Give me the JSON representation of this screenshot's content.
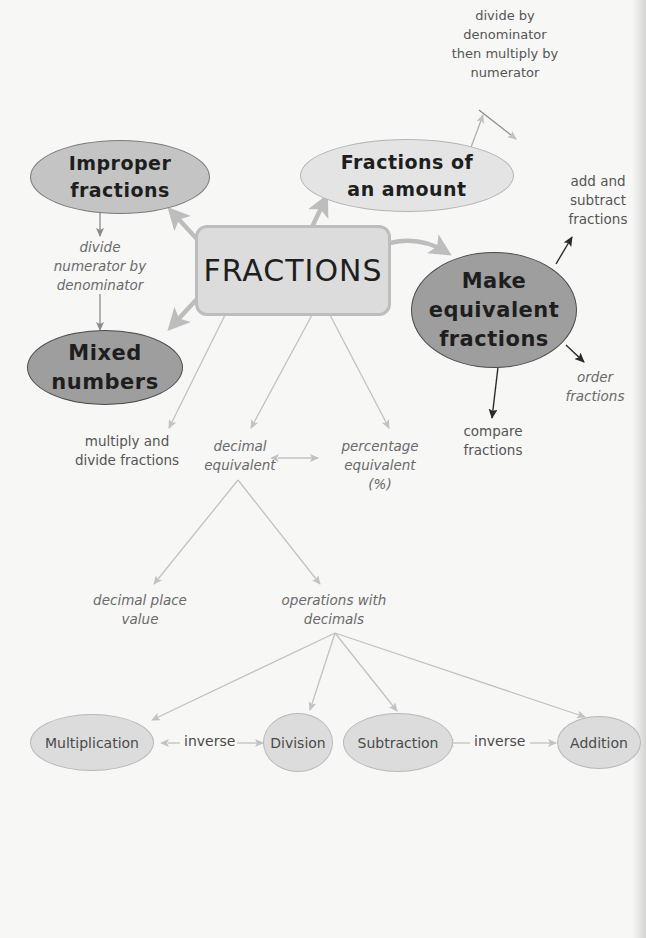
{
  "diagram": {
    "title": "FRACTIONS",
    "central": {
      "label": "FRACTIONS"
    },
    "main_nodes": {
      "improper": {
        "label": "Improper\nfractions",
        "line1": "Improper",
        "line2": "fractions"
      },
      "mixed": {
        "label": "Mixed\nnumbers",
        "line1": "Mixed",
        "line2": "numbers"
      },
      "amount": {
        "label": "Fractions of\nan amount",
        "line1": "Fractions of",
        "line2": "an amount"
      },
      "equivalent": {
        "label": "Make\nequivalent\nfractions",
        "line1": "Make",
        "line2": "equivalent",
        "line3": "fractions"
      }
    },
    "annotations": {
      "divide_numerator": "divide\nnumerator by\ndenominator",
      "amount_method": "divide by\ndenominator\nthen multiply by\nnumerator",
      "add_subtract": "add and\nsubtract\nfractions",
      "order": "order\nfractions",
      "compare": "compare\nfractions",
      "multiply_divide": "multiply and\ndivide fractions",
      "decimal_equivalent": "decimal\nequivalent",
      "percentage_equivalent": "percentage\nequivalent\n(%)",
      "decimal_place_value": "decimal place\nvalue",
      "operations_decimals": "operations with\ndecimals"
    },
    "operations": [
      {
        "label": "Multiplication"
      },
      {
        "label": "Division"
      },
      {
        "label": "Subtraction"
      },
      {
        "label": "Addition"
      }
    ],
    "relations": {
      "mult_div": "inverse",
      "sub_add": "inverse"
    },
    "colors": {
      "background": "#f7f7f6",
      "dark_node": "#9e9e9e",
      "mid_node": "#c4c4c4",
      "light_node": "#e4e4e4",
      "central_fill": "#dcdcdc",
      "thick_arrow": "#bdbdbd",
      "thin_line": "#c2c2c2",
      "dark_arrow": "#3a3a3a"
    }
  }
}
